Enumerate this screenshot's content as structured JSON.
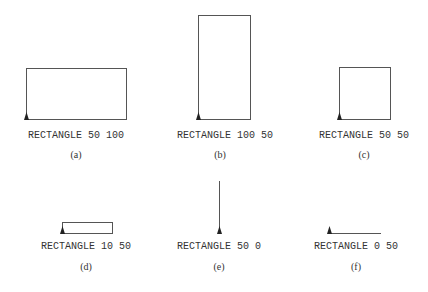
{
  "figure": {
    "panels": [
      {
        "id": "a",
        "caption": "(a)",
        "command": "RECTANGLE 50 100",
        "height": 50,
        "width": 100
      },
      {
        "id": "b",
        "caption": "(b)",
        "command": "RECTANGLE 100 50",
        "height": 100,
        "width": 50
      },
      {
        "id": "c",
        "caption": "(c)",
        "command": "RECTANGLE 50 50",
        "height": 50,
        "width": 50
      },
      {
        "id": "d",
        "caption": "(d)",
        "command": "RECTANGLE 10 50",
        "height": 10,
        "width": 50
      },
      {
        "id": "e",
        "caption": "(e)",
        "command": "RECTANGLE 50 0",
        "height": 50,
        "width": 0
      },
      {
        "id": "f",
        "caption": "(f)",
        "command": "RECTANGLE 0 50",
        "height": 0,
        "width": 50
      }
    ],
    "colors": {
      "stroke": "#555555",
      "turtle": "#222222",
      "text": "#333333"
    }
  }
}
